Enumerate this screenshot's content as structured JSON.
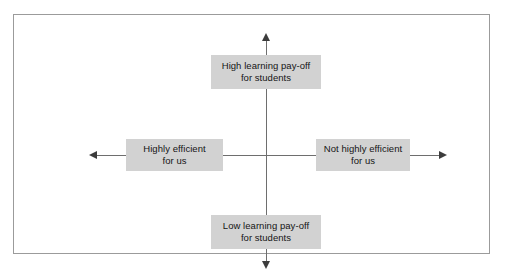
{
  "figure": {
    "type": "two-axis quadrant matrix",
    "frame": {
      "border_color": "#9b9b9b",
      "background_color": "#ffffff"
    },
    "axes": {
      "color": "#6e6e6e",
      "arrowhead_color": "#3c3c3c",
      "vertical": {
        "name": "learning pay-off for students",
        "top_end": "High learning pay-off for students",
        "bottom_end": "Low learning pay-off for students"
      },
      "horizontal": {
        "name": "efficiency for us",
        "left_end": "Highly efficient for us",
        "right_end": "Not highly efficient for us"
      }
    },
    "box_fill_color": "#d2d2d2",
    "labels": {
      "top": {
        "line1": "High learning pay-off",
        "line2": "for students"
      },
      "bottom": {
        "line1": "Low learning pay-off",
        "line2": "for students"
      },
      "left": {
        "line1": "Highly efficient",
        "line2": "for us"
      },
      "right": {
        "line1": "Not highly efficient",
        "line2": "for us"
      }
    }
  }
}
